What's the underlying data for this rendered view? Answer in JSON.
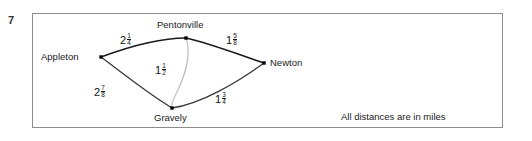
{
  "question": {
    "number": "7"
  },
  "figure": {
    "caption": "All distances are in miles",
    "nodes": [
      {
        "id": "appleton",
        "label": "Appleton"
      },
      {
        "id": "pentonville",
        "label": "Pentonville"
      },
      {
        "id": "gravely",
        "label": "Gravely"
      },
      {
        "id": "newton",
        "label": "Newton"
      }
    ],
    "edges": [
      {
        "id": "appleton-pentonville",
        "from": "Appleton",
        "to": "Pentonville",
        "whole": "2",
        "numerator": "1",
        "denominator": "4",
        "value": "2 1/4"
      },
      {
        "id": "pentonville-newton",
        "from": "Pentonville",
        "to": "Newton",
        "whole": "1",
        "numerator": "5",
        "denominator": "8",
        "value": "1 5/8"
      },
      {
        "id": "pentonville-gravely",
        "from": "Pentonville",
        "to": "Gravely",
        "whole": "1",
        "numerator": "1",
        "denominator": "2",
        "value": "1 1/2"
      },
      {
        "id": "appleton-gravely",
        "from": "Appleton",
        "to": "Gravely",
        "whole": "2",
        "numerator": "7",
        "denominator": "8",
        "value": "2 7/8"
      },
      {
        "id": "gravely-newton",
        "from": "Gravely",
        "to": "Newton",
        "whole": "1",
        "numerator": "3",
        "denominator": "4",
        "value": "1 3/4"
      }
    ],
    "colors": {
      "edge_dark": "#1b1b1b",
      "edge_light": "#c3c3c3",
      "border": "#8d8d8d",
      "node": "#000000"
    }
  }
}
